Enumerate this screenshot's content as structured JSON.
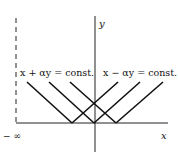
{
  "labels": {
    "y_axis": "y",
    "x_axis": "x",
    "neg_infinity": "− ∞",
    "left_family": "x + αy = const.",
    "right_family": "x − αy = const."
  },
  "diagram": {
    "type": "characteristic lines",
    "descending_lines": [
      [
        27,
        82,
        72,
        123
      ],
      [
        49,
        82,
        94,
        123
      ],
      [
        70,
        82,
        116,
        123
      ]
    ],
    "ascending_lines": [
      [
        72,
        123,
        118,
        82
      ],
      [
        94,
        123,
        140,
        82
      ],
      [
        116,
        123,
        163,
        82
      ]
    ]
  }
}
